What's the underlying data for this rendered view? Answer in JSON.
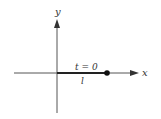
{
  "diagram": {
    "axes": {
      "x_label": "x",
      "y_label": "y"
    },
    "segment": {
      "top_label": "t = 0",
      "bottom_label": "l"
    },
    "colors": {
      "axis": "#555555",
      "segment": "#222222",
      "point": "#111111",
      "background": "#ffffff"
    }
  }
}
